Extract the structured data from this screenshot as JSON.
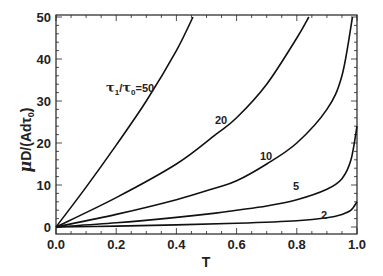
{
  "chart_data": {
    "type": "line",
    "title": "",
    "xlabel": "T",
    "ylabel": "μD/(Adτ0)",
    "xlim": [
      0.0,
      1.0
    ],
    "ylim": [
      0,
      50
    ],
    "grid": false,
    "legend": "inline curve labels",
    "x_ticks": [
      "0.0",
      "0.2",
      "0.4",
      "0.6",
      "0.8",
      "1.0"
    ],
    "y_ticks": [
      "0",
      "10",
      "20",
      "30",
      "40",
      "50"
    ],
    "series": [
      {
        "name": "τ1/τ0=50",
        "label": "τ1/τ0=50",
        "x": [
          0.0,
          0.1,
          0.2,
          0.3,
          0.4,
          0.455
        ],
        "y": [
          0,
          9.5,
          19.5,
          30,
          42,
          50
        ]
      },
      {
        "name": "20",
        "label": "20",
        "x": [
          0.0,
          0.2,
          0.4,
          0.53,
          0.6,
          0.7,
          0.8,
          0.84
        ],
        "y": [
          0,
          7,
          15,
          22,
          26,
          34,
          45,
          50
        ]
      },
      {
        "name": "10",
        "label": "10",
        "x": [
          0.0,
          0.2,
          0.4,
          0.53,
          0.6,
          0.7,
          0.8,
          0.9,
          0.95,
          0.985
        ],
        "y": [
          0,
          3,
          6.5,
          9.3,
          11,
          15,
          20,
          28,
          36,
          50
        ]
      },
      {
        "name": "5",
        "label": "5",
        "x": [
          0.0,
          0.2,
          0.4,
          0.53,
          0.6,
          0.7,
          0.8,
          0.9,
          0.95,
          0.98,
          1.0
        ],
        "y": [
          0,
          1,
          2.3,
          3.3,
          4,
          5,
          6.5,
          9,
          11.5,
          16,
          24
        ]
      },
      {
        "name": "2",
        "label": "2",
        "x": [
          0.0,
          0.2,
          0.4,
          0.6,
          0.8,
          0.9,
          0.95,
          0.98,
          1.0
        ],
        "y": [
          0,
          0.2,
          0.5,
          0.9,
          1.5,
          2.2,
          3,
          4,
          6
        ]
      }
    ]
  },
  "labels": {
    "x_axis": "T",
    "y_axis_mu": "μ",
    "y_axis_rest": "D/(Adτ",
    "y_axis_sub": "0",
    "y_axis_close": ")",
    "curve_50_tau1": "τ",
    "curve_50_sub1": "1",
    "curve_50_slash": "/",
    "curve_50_tau0": "τ",
    "curve_50_sub0": "0",
    "curve_50_value": "=50",
    "curve_20": "20",
    "curve_10": "10",
    "curve_5": "5",
    "curve_2": "2"
  }
}
